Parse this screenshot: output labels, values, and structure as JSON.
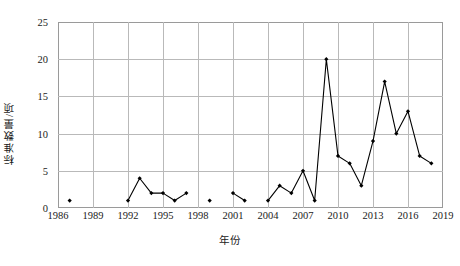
{
  "chart_data": {
    "type": "line",
    "title": "",
    "xlabel": "年份",
    "ylabel": "标准数量/项",
    "xlim": [
      1986,
      2019
    ],
    "ylim": [
      0,
      25
    ],
    "ytick_values": [
      0,
      5,
      10,
      15,
      20,
      25
    ],
    "ytick_labels": [
      "0",
      "5",
      "10",
      "15",
      "20",
      "25"
    ],
    "xtick_values": [
      1986,
      1989,
      1992,
      1995,
      1998,
      2001,
      2004,
      2007,
      2010,
      2013,
      2016,
      2019
    ],
    "xtick_labels": [
      "1986",
      "1989",
      "1992",
      "1995",
      "1998",
      "2001",
      "2004",
      "2007",
      "2010",
      "2013",
      "2016",
      "2019"
    ],
    "grid": true,
    "legend": "none",
    "marker": "filled-diamond",
    "line_color": "#000000",
    "marker_color": "#000000",
    "grid_color": "#b9b9b9",
    "frame_color": "#9a9a9a",
    "series": [
      {
        "name": "标准数量",
        "x": [
          1987,
          1992,
          1993,
          1994,
          1995,
          1996,
          1997,
          1999,
          2001,
          2002,
          2004,
          2005,
          2006,
          2007,
          2008,
          2009,
          2010,
          2011,
          2012,
          2013,
          2014,
          2015,
          2016,
          2017,
          2018
        ],
        "values": [
          1,
          1,
          4,
          2,
          2,
          1,
          2,
          1,
          2,
          1,
          1,
          3,
          2,
          5,
          1,
          20,
          7,
          6,
          3,
          9,
          17,
          10,
          13,
          7,
          6
        ]
      }
    ],
    "segments": [
      {
        "x": [
          1987
        ],
        "values": [
          1
        ]
      },
      {
        "x": [
          1992,
          1993,
          1994,
          1995,
          1996,
          1997
        ],
        "values": [
          1,
          4,
          2,
          2,
          1,
          2
        ]
      },
      {
        "x": [
          1999
        ],
        "values": [
          1
        ]
      },
      {
        "x": [
          2001,
          2002
        ],
        "values": [
          2,
          1
        ]
      },
      {
        "x": [
          2004,
          2005,
          2006,
          2007,
          2008,
          2009,
          2010,
          2011,
          2012,
          2013,
          2014,
          2015,
          2016,
          2017,
          2018
        ],
        "values": [
          1,
          3,
          2,
          5,
          1,
          20,
          7,
          6,
          3,
          9,
          17,
          10,
          13,
          7,
          6
        ]
      }
    ]
  }
}
